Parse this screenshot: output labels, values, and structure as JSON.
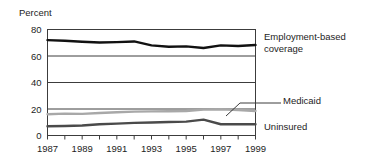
{
  "chart_data": {
    "type": "line",
    "title": "",
    "ylabel": "Percent",
    "xlabel": "",
    "ylim": [
      0,
      80
    ],
    "yticks": [
      0,
      20,
      40,
      60,
      80
    ],
    "xlim": [
      1987,
      1999
    ],
    "x": [
      1987,
      1988,
      1989,
      1990,
      1991,
      1992,
      1993,
      1994,
      1995,
      1996,
      1997,
      1998,
      1999
    ],
    "xtick_labels": [
      "1987",
      "1989",
      "1991",
      "1993",
      "1995",
      "1997",
      "1999"
    ],
    "xticks": [
      1987,
      1989,
      1991,
      1993,
      1995,
      1997,
      1999
    ],
    "grid": true,
    "legend_position": "right-inline-labels",
    "series": [
      {
        "name": "Employment-based coverage",
        "color": "#111111",
        "values": [
          72.0,
          71.5,
          70.8,
          70.2,
          70.5,
          71.0,
          68.0,
          67.0,
          67.3,
          66.0,
          68.0,
          67.5,
          68.3
        ]
      },
      {
        "name": "Medicaid",
        "color": "#a8a8a8",
        "values": [
          16.0,
          16.5,
          16.3,
          17.0,
          17.5,
          18.0,
          18.2,
          18.3,
          18.5,
          19.5,
          19.8,
          19.3,
          18.5
        ]
      },
      {
        "name": "Uninsured",
        "color": "#4a4a4a",
        "values": [
          7.0,
          7.2,
          7.5,
          8.5,
          9.0,
          9.5,
          9.8,
          10.2,
          10.5,
          12.0,
          8.5,
          8.5,
          8.5
        ]
      }
    ]
  },
  "labels": {
    "employment": "Employment-based coverage",
    "medicaid": "Medicaid",
    "uninsured": "Uninsured",
    "percent": "Percent"
  }
}
